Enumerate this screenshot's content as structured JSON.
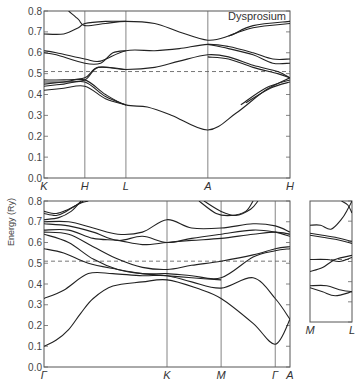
{
  "chart_data": {
    "type": "line",
    "title": "Dysprosium",
    "ylabel": "Energy (Ry)",
    "ylim": [
      0.0,
      0.8
    ],
    "yticks": [
      "0.0",
      "0.1",
      "0.2",
      "0.3",
      "0.4",
      "0.5",
      "0.6",
      "0.7",
      "0.8"
    ],
    "fermi_level": 0.51,
    "panels": [
      {
        "name": "top",
        "symmetry_points": [
          "K",
          "H",
          "L",
          "A",
          "H"
        ],
        "symmetry_positions": [
          0,
          0.166,
          0.333,
          0.666,
          1.0
        ],
        "series": [
          {
            "x": [
              0.1,
              0.14,
              0.166,
              0.25,
              0.333,
              0.45,
              0.55,
              0.666,
              0.75,
              0.85,
              1.0
            ],
            "y": [
              0.8,
              0.76,
              0.73,
              0.74,
              0.75,
              0.74,
              0.7,
              0.66,
              0.68,
              0.73,
              0.75
            ]
          },
          {
            "x": [
              0,
              0.08,
              0.14,
              0.166,
              0.25,
              0.333
            ],
            "y": [
              0.69,
              0.69,
              0.72,
              0.74,
              0.75,
              0.75
            ]
          },
          {
            "x": [
              0.75,
              0.85,
              1.0
            ],
            "y": [
              0.68,
              0.72,
              0.74
            ]
          },
          {
            "x": [
              0,
              0.05,
              0.166,
              0.23,
              0.333,
              0.45,
              0.55,
              0.666,
              0.75,
              0.85,
              0.93,
              1.0
            ],
            "y": [
              0.61,
              0.6,
              0.57,
              0.56,
              0.61,
              0.61,
              0.62,
              0.64,
              0.63,
              0.6,
              0.57,
              0.57
            ]
          },
          {
            "x": [
              0,
              0.05,
              0.166,
              0.23,
              0.28,
              0.333
            ],
            "y": [
              0.6,
              0.59,
              0.55,
              0.55,
              0.6,
              0.61
            ]
          },
          {
            "x": [
              0.666,
              0.75,
              0.85,
              0.93,
              1.0
            ],
            "y": [
              0.64,
              0.62,
              0.59,
              0.55,
              0.55
            ]
          },
          {
            "x": [
              0,
              0.08,
              0.166,
              0.22,
              0.333,
              0.45,
              0.55,
              0.666,
              0.75,
              0.85,
              0.95,
              1.0
            ],
            "y": [
              0.47,
              0.47,
              0.48,
              0.53,
              0.52,
              0.53,
              0.56,
              0.59,
              0.58,
              0.54,
              0.51,
              0.48
            ]
          },
          {
            "x": [
              0,
              0.08,
              0.166,
              0.22,
              0.333
            ],
            "y": [
              0.46,
              0.46,
              0.47,
              0.53,
              0.52
            ]
          },
          {
            "x": [
              0.666,
              0.75,
              0.85,
              0.95,
              1.0
            ],
            "y": [
              0.58,
              0.57,
              0.53,
              0.5,
              0.48
            ]
          },
          {
            "x": [
              0,
              0.08,
              0.166,
              0.25,
              0.333,
              0.42,
              0.52,
              0.666,
              0.78,
              0.9,
              1.0
            ],
            "y": [
              0.45,
              0.46,
              0.47,
              0.4,
              0.35,
              0.34,
              0.3,
              0.23,
              0.31,
              0.42,
              0.48
            ]
          },
          {
            "x": [
              0,
              0.08,
              0.166,
              0.25,
              0.333
            ],
            "y": [
              0.44,
              0.45,
              0.46,
              0.39,
              0.35
            ]
          },
          {
            "x": [
              0,
              0.08,
              0.166,
              0.25,
              0.333
            ],
            "y": [
              0.42,
              0.43,
              0.44,
              0.38,
              0.35
            ]
          },
          {
            "x": [
              0.8,
              0.9,
              1.0
            ],
            "y": [
              0.35,
              0.43,
              0.47
            ]
          },
          {
            "x": [
              0.82,
              0.92,
              1.0
            ],
            "y": [
              0.36,
              0.43,
              0.46
            ]
          }
        ]
      },
      {
        "name": "bottom",
        "symmetry_points": [
          "Γ",
          "K",
          "M",
          "Γ",
          "A"
        ],
        "symmetry_positions": [
          0,
          0.5,
          0.72,
          0.94,
          1.0
        ],
        "series": [
          {
            "x": [
              0,
              0.05,
              0.1,
              0.15,
              0.2,
              0.28,
              0.4,
              0.5,
              0.62,
              0.72,
              0.85,
              0.94,
              1.0
            ],
            "y": [
              0.1,
              0.13,
              0.18,
              0.26,
              0.33,
              0.39,
              0.41,
              0.42,
              0.38,
              0.33,
              0.21,
              0.11,
              0.23
            ]
          },
          {
            "x": [
              0,
              0.08,
              0.18,
              0.28,
              0.4,
              0.5,
              0.6,
              0.72,
              0.85,
              0.94,
              1.0
            ],
            "y": [
              0.33,
              0.37,
              0.45,
              0.45,
              0.44,
              0.44,
              0.41,
              0.38,
              0.43,
              0.33,
              0.23
            ]
          },
          {
            "x": [
              0,
              0.08,
              0.18,
              0.3,
              0.4,
              0.5,
              0.6,
              0.72
            ],
            "y": [
              0.57,
              0.55,
              0.5,
              0.47,
              0.45,
              0.44,
              0.43,
              0.42
            ]
          },
          {
            "x": [
              0,
              0.1,
              0.2,
              0.3,
              0.4,
              0.5,
              0.6,
              0.72,
              0.85,
              0.94,
              1.0
            ],
            "y": [
              0.64,
              0.6,
              0.52,
              0.47,
              0.45,
              0.45,
              0.44,
              0.43,
              0.53,
              0.56,
              0.57
            ]
          },
          {
            "x": [
              0,
              0.1,
              0.2,
              0.3,
              0.4,
              0.5,
              0.6,
              0.72,
              0.85,
              0.94,
              1.0
            ],
            "y": [
              0.65,
              0.64,
              0.58,
              0.52,
              0.48,
              0.47,
              0.49,
              0.51,
              0.54,
              0.57,
              0.58
            ]
          },
          {
            "x": [
              0,
              0.1,
              0.2,
              0.3,
              0.4,
              0.5,
              0.6,
              0.72,
              0.85,
              0.94,
              1.0
            ],
            "y": [
              0.66,
              0.66,
              0.62,
              0.61,
              0.59,
              0.6,
              0.61,
              0.62,
              0.64,
              0.65,
              0.64
            ]
          },
          {
            "x": [
              0,
              0.1,
              0.2,
              0.3,
              0.4,
              0.5,
              0.6,
              0.72,
              0.85,
              0.94,
              1.0
            ],
            "y": [
              0.69,
              0.68,
              0.65,
              0.61,
              0.63,
              0.6,
              0.62,
              0.64,
              0.66,
              0.65,
              0.63
            ]
          },
          {
            "x": [
              0,
              0.1,
              0.2,
              0.3,
              0.4,
              0.5,
              0.6,
              0.72,
              0.85,
              0.94,
              1.0
            ],
            "y": [
              0.7,
              0.7,
              0.67,
              0.64,
              0.65,
              0.71,
              0.67,
              0.67,
              0.69,
              0.68,
              0.65
            ]
          },
          {
            "x": [
              0,
              0.05,
              0.09,
              0.13,
              0.16
            ],
            "y": [
              0.74,
              0.73,
              0.75,
              0.78,
              0.8
            ]
          },
          {
            "x": [
              0,
              0.05,
              0.1,
              0.15,
              0.18
            ],
            "y": [
              0.75,
              0.74,
              0.76,
              0.79,
              0.8
            ]
          },
          {
            "x": [
              0.0,
              0.06,
              0.11,
              0.15
            ],
            "y": [
              0.71,
              0.72,
              0.75,
              0.8
            ]
          },
          {
            "x": [
              0.63,
              0.7,
              0.76,
              0.82,
              0.85
            ],
            "y": [
              0.8,
              0.74,
              0.73,
              0.75,
              0.8
            ]
          },
          {
            "x": [
              0.65,
              0.72,
              0.78,
              0.84,
              0.87
            ],
            "y": [
              0.8,
              0.75,
              0.73,
              0.76,
              0.8
            ]
          }
        ]
      },
      {
        "name": "side",
        "symmetry_points": [
          "M",
          "L"
        ],
        "symmetry_positions": [
          0,
          1.0
        ],
        "series": [
          {
            "x": [
              0,
              0.25,
              0.5,
              0.75,
              0.9,
              1.0
            ],
            "y": [
              0.68,
              0.68,
              0.66,
              0.71,
              0.76,
              0.8
            ]
          },
          {
            "x": [
              0.75,
              0.9,
              1.0
            ],
            "y": [
              0.8,
              0.78,
              0.74
            ]
          },
          {
            "x": [
              0,
              0.3,
              0.6,
              1.0
            ],
            "y": [
              0.64,
              0.63,
              0.62,
              0.6
            ]
          },
          {
            "x": [
              0,
              0.3,
              0.6,
              1.0
            ],
            "y": [
              0.63,
              0.62,
              0.61,
              0.59
            ]
          },
          {
            "x": [
              0,
              0.4,
              0.7,
              1.0
            ],
            "y": [
              0.51,
              0.51,
              0.5,
              0.52
            ]
          },
          {
            "x": [
              0,
              0.3,
              0.6,
              1.0
            ],
            "y": [
              0.45,
              0.47,
              0.51,
              0.53
            ]
          },
          {
            "x": [
              0,
              0.4,
              0.7,
              1.0
            ],
            "y": [
              0.38,
              0.38,
              0.36,
              0.35
            ]
          },
          {
            "x": [
              0,
              0.3,
              0.6,
              1.0
            ],
            "y": [
              0.37,
              0.35,
              0.33,
              0.35
            ]
          }
        ]
      }
    ]
  }
}
